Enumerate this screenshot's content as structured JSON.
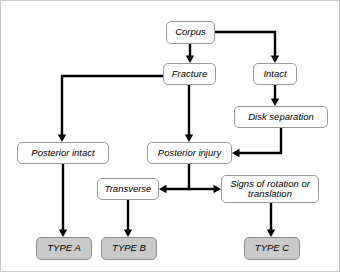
{
  "diagram": {
    "type": "flowchart",
    "canvas": {
      "width": 340,
      "height": 272,
      "background": "#ffffff",
      "border_color": "#c9c9c9"
    },
    "style": {
      "node_fill": "#ffffff",
      "node_border": "#9a9a9a",
      "terminal_fill": "#c9c9c9",
      "terminal_border": "#8e8e8e",
      "edge_color": "#000000",
      "text_color": "#000000"
    },
    "nodes": [
      {
        "id": "corpus",
        "label": "Corpus",
        "kind": "decision",
        "x": 165,
        "y": 20,
        "w": 49,
        "h": 23,
        "font": 9.5
      },
      {
        "id": "fracture",
        "label": "Fracture",
        "kind": "decision",
        "x": 162,
        "y": 62,
        "w": 53,
        "h": 22,
        "font": 9.5
      },
      {
        "id": "intact",
        "label": "Intact",
        "kind": "decision",
        "x": 252,
        "y": 62,
        "w": 44,
        "h": 22,
        "font": 9.5
      },
      {
        "id": "disk-separation",
        "label": "Disk separation",
        "kind": "decision",
        "x": 233,
        "y": 105,
        "w": 94,
        "h": 22,
        "font": 9.5
      },
      {
        "id": "posterior-intact",
        "label": "Posterior intact",
        "kind": "decision",
        "x": 16,
        "y": 141,
        "w": 92,
        "h": 22,
        "font": 9.5
      },
      {
        "id": "posterior-injury",
        "label": "Posterior injury",
        "kind": "decision",
        "x": 146,
        "y": 141,
        "w": 85,
        "h": 22,
        "font": 9.5
      },
      {
        "id": "transverse",
        "label": "Transverse",
        "kind": "decision",
        "x": 96,
        "y": 177,
        "w": 62,
        "h": 22,
        "font": 9.5
      },
      {
        "id": "signs-rotation",
        "label": "Signs of rotation or\ntranslation",
        "kind": "decision",
        "x": 220,
        "y": 174,
        "w": 98,
        "h": 28,
        "font": 9.5
      },
      {
        "id": "type-a",
        "label": "TYPE A",
        "kind": "terminal",
        "x": 35,
        "y": 236,
        "w": 56,
        "h": 23,
        "font": 9.5
      },
      {
        "id": "type-b",
        "label": "TYPE B",
        "kind": "terminal",
        "x": 100,
        "y": 236,
        "w": 56,
        "h": 23,
        "font": 9.5
      },
      {
        "id": "type-c",
        "label": "TYPE C",
        "kind": "terminal",
        "x": 243,
        "y": 236,
        "w": 56,
        "h": 23,
        "font": 9.5
      }
    ],
    "edges": [
      {
        "id": "corpus-to-fracture",
        "from": "corpus",
        "to": "fracture",
        "path": "M 189,43 L 189,58",
        "arrow_at": [
          189,
          62
        ]
      },
      {
        "id": "corpus-to-intact",
        "from": "corpus",
        "to": "intact",
        "path": "M 214,31 L 274,31 L 274,58",
        "arrow_at": [
          274,
          62
        ]
      },
      {
        "id": "fracture-to-posterior-intact",
        "from": "fracture",
        "to": "posterior-intact",
        "path": "M 162,75 L 61,75 L 61,137",
        "arrow_at": [
          61,
          141
        ]
      },
      {
        "id": "fracture-to-posterior-injury",
        "from": "fracture",
        "to": "posterior-injury",
        "path": "M 188,84 L 188,137",
        "arrow_at": [
          188,
          141
        ]
      },
      {
        "id": "intact-to-disk-separation",
        "from": "intact",
        "to": "disk-separation",
        "path": "M 274,84 L 274,101",
        "arrow_at": [
          274,
          105
        ]
      },
      {
        "id": "disk-separation-to-posterior-injury",
        "from": "disk-separation",
        "to": "posterior-injury",
        "path": "M 280,127 L 280,152 L 236,152",
        "arrow_at": [
          231,
          152
        ]
      },
      {
        "id": "posterior-intact-to-type-a",
        "from": "posterior-intact",
        "to": "type-a",
        "path": "M 62,163 L 62,232",
        "arrow_at": [
          62,
          236
        ]
      },
      {
        "id": "posterior-injury-to-split",
        "from": "posterior-injury",
        "to": "transverse",
        "path": "M 188,163 L 188,188 L 163,188",
        "arrow_at": [
          158,
          188
        ]
      },
      {
        "id": "posterior-injury-to-signs",
        "from": "posterior-injury",
        "to": "signs-rotation",
        "path": "M 188,188 L 215,188",
        "arrow_at": [
          220,
          188
        ]
      },
      {
        "id": "transverse-to-type-b",
        "from": "transverse",
        "to": "type-b",
        "path": "M 127,199 L 127,232",
        "arrow_at": [
          127,
          236
        ]
      },
      {
        "id": "signs-to-type-c",
        "from": "signs-rotation",
        "to": "type-c",
        "path": "M 270,202 L 270,232",
        "arrow_at": [
          270,
          236
        ]
      }
    ]
  }
}
